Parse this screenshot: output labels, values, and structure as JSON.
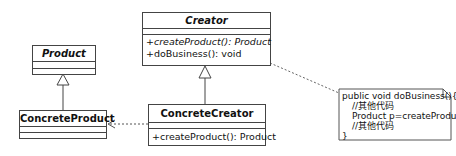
{
  "diagram": {
    "type": "uml-class-diagram",
    "pattern": "Factory Method",
    "classes": {
      "product": {
        "name": "Product",
        "abstract": true,
        "operations": []
      },
      "concrete_product": {
        "name": "ConcreteProduct",
        "abstract": false,
        "operations": []
      },
      "creator": {
        "name": "Creator",
        "abstract": true,
        "operations": [
          {
            "text": "+createProduct(): Product",
            "abstract": true
          },
          {
            "text": "+doBusiness(): void",
            "abstract": false
          }
        ]
      },
      "concrete_creator": {
        "name": "ConcreteCreator",
        "abstract": false,
        "operations": [
          {
            "text": "+createProduct(): Product",
            "abstract": false
          }
        ]
      }
    },
    "note": {
      "lines": [
        "public void doBusiness(){",
        "//其他代码",
        "Product p=createProduct();",
        "//其他代码",
        "}"
      ]
    },
    "relationships": [
      {
        "type": "generalization",
        "from": "ConcreteProduct",
        "to": "Product"
      },
      {
        "type": "generalization",
        "from": "ConcreteCreator",
        "to": "Creator"
      },
      {
        "type": "dependency",
        "from": "ConcreteCreator",
        "to": "ConcreteProduct"
      },
      {
        "type": "note-anchor",
        "from": "note",
        "to": "Creator"
      }
    ],
    "colors": {
      "line": "#444444",
      "background": "#ffffff",
      "text": "#111111"
    }
  }
}
